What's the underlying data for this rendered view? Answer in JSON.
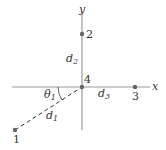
{
  "axes": {
    "x_label": "x",
    "y_label": "y"
  },
  "points": [
    {
      "id": "1",
      "label": "1"
    },
    {
      "id": "2",
      "label": "2"
    },
    {
      "id": "3",
      "label": "3"
    },
    {
      "id": "4",
      "label": "4"
    }
  ],
  "distances": {
    "d1": "d",
    "d1_sub": "1",
    "d2": "d",
    "d2_sub": "2",
    "d3": "d",
    "d3_sub": "3"
  },
  "angle": {
    "symbol": "θ",
    "sub": "1"
  },
  "colors": {
    "axis": "#999999",
    "point": "#666666",
    "text": "#333333"
  }
}
